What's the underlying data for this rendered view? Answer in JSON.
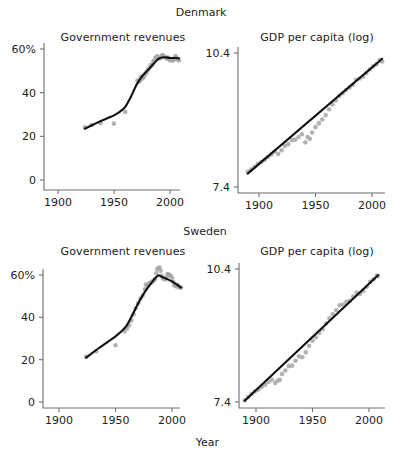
{
  "figure": {
    "x_axis_label": "Year",
    "groups": [
      {
        "name": "Denmark"
      },
      {
        "name": "Sweden"
      }
    ],
    "panel_titles": {
      "revenues": "Government revenues",
      "gdp": "GDP per capita (log)"
    },
    "colors": {
      "fit_line": "#101010",
      "points": "#a6a6a6",
      "axis": "#6e6e6e",
      "text": "#222222",
      "background": "#ffffff"
    }
  },
  "chart_data": [
    {
      "id": "denmark-government-revenues",
      "type": "scatter",
      "title": "Government revenues",
      "group": "Denmark",
      "xlabel": "Year",
      "ylabel": "",
      "xlim": [
        1885,
        2012
      ],
      "ylim": [
        0,
        65
      ],
      "xticks": [
        1900,
        1950,
        2000
      ],
      "xticklabels": [
        "1900",
        "1950",
        "2000"
      ],
      "yticks": [
        0,
        20,
        40,
        60
      ],
      "yticklabels": [
        "0",
        "20",
        "40",
        "60%"
      ],
      "grid": false,
      "legend": "none",
      "points": [
        [
          1924,
          24.1
        ],
        [
          1930,
          25.2
        ],
        [
          1938,
          26.0
        ],
        [
          1950,
          25.8
        ],
        [
          1960,
          31.2
        ],
        [
          1971,
          45.6
        ],
        [
          1972,
          45.1
        ],
        [
          1973,
          45.3
        ],
        [
          1974,
          47.3
        ],
        [
          1975,
          46.4
        ],
        [
          1976,
          46.9
        ],
        [
          1977,
          47.8
        ],
        [
          1978,
          48.8
        ],
        [
          1979,
          49.2
        ],
        [
          1980,
          50.3
        ],
        [
          1981,
          50.9
        ],
        [
          1982,
          51.6
        ],
        [
          1983,
          52.7
        ],
        [
          1984,
          52.6
        ],
        [
          1985,
          54.2
        ],
        [
          1986,
          54.6
        ],
        [
          1987,
          55.9
        ],
        [
          1988,
          56.4
        ],
        [
          1989,
          56.6
        ],
        [
          1990,
          55.8
        ],
        [
          1991,
          55.7
        ],
        [
          1992,
          56.1
        ],
        [
          1993,
          57.1
        ],
        [
          1994,
          57.0
        ],
        [
          1995,
          56.4
        ],
        [
          1996,
          56.1
        ],
        [
          1997,
          55.6
        ],
        [
          1998,
          56.1
        ],
        [
          1999,
          55.5
        ],
        [
          2000,
          54.7
        ],
        [
          2001,
          55.1
        ],
        [
          2002,
          54.9
        ],
        [
          2003,
          54.9
        ],
        [
          2004,
          55.7
        ],
        [
          2005,
          56.8
        ],
        [
          2006,
          55.8
        ],
        [
          2007,
          55.2
        ],
        [
          2008,
          54.8
        ]
      ],
      "fit_curve": [
        [
          1924,
          23.5
        ],
        [
          1930,
          25.0
        ],
        [
          1935,
          26.3
        ],
        [
          1940,
          27.4
        ],
        [
          1945,
          28.5
        ],
        [
          1950,
          29.6
        ],
        [
          1955,
          31.2
        ],
        [
          1960,
          33.5
        ],
        [
          1965,
          38.0
        ],
        [
          1970,
          43.5
        ],
        [
          1975,
          47.5
        ],
        [
          1980,
          50.2
        ],
        [
          1985,
          53.0
        ],
        [
          1990,
          55.6
        ],
        [
          1995,
          56.2
        ],
        [
          2000,
          55.9
        ],
        [
          2005,
          55.9
        ],
        [
          2008,
          55.7
        ]
      ]
    },
    {
      "id": "denmark-gdp-per-capita-log",
      "type": "scatter",
      "title": "GDP per capita (log)",
      "group": "Denmark",
      "xlabel": "Year",
      "ylabel": "",
      "xlim": [
        1885,
        2012
      ],
      "ylim": [
        7.4,
        10.55
      ],
      "xticks": [
        1900,
        1950,
        2000
      ],
      "xticklabels": [
        "1900",
        "1950",
        "2000"
      ],
      "yticks": [
        7.4,
        10.4
      ],
      "yticklabels": [
        "7.4",
        "10.4"
      ],
      "grid": false,
      "legend": "none",
      "points": [
        [
          1890,
          7.74
        ],
        [
          1893,
          7.79
        ],
        [
          1896,
          7.85
        ],
        [
          1899,
          7.92
        ],
        [
          1902,
          7.96
        ],
        [
          1905,
          8.01
        ],
        [
          1908,
          8.07
        ],
        [
          1911,
          8.13
        ],
        [
          1914,
          8.19
        ],
        [
          1917,
          8.14
        ],
        [
          1920,
          8.22
        ],
        [
          1923,
          8.32
        ],
        [
          1926,
          8.36
        ],
        [
          1929,
          8.45
        ],
        [
          1932,
          8.46
        ],
        [
          1935,
          8.52
        ],
        [
          1938,
          8.58
        ],
        [
          1941,
          8.4
        ],
        [
          1943,
          8.52
        ],
        [
          1945,
          8.48
        ],
        [
          1947,
          8.62
        ],
        [
          1950,
          8.74
        ],
        [
          1953,
          8.83
        ],
        [
          1956,
          8.91
        ],
        [
          1959,
          9.01
        ],
        [
          1962,
          9.14
        ],
        [
          1965,
          9.25
        ],
        [
          1968,
          9.34
        ],
        [
          1971,
          9.44
        ],
        [
          1974,
          9.5
        ],
        [
          1977,
          9.57
        ],
        [
          1980,
          9.63
        ],
        [
          1983,
          9.69
        ],
        [
          1986,
          9.8
        ],
        [
          1989,
          9.83
        ],
        [
          1992,
          9.87
        ],
        [
          1995,
          9.95
        ],
        [
          1998,
          10.03
        ],
        [
          2001,
          10.1
        ],
        [
          2004,
          10.15
        ],
        [
          2007,
          10.24
        ],
        [
          2009,
          10.21
        ]
      ],
      "fit_line": [
        [
          1890,
          7.7
        ],
        [
          2009,
          10.27
        ]
      ]
    },
    {
      "id": "sweden-government-revenues",
      "type": "scatter",
      "title": "Government revenues",
      "group": "Sweden",
      "xlabel": "Year",
      "ylabel": "",
      "xlim": [
        1885,
        2012
      ],
      "ylim": [
        0,
        68
      ],
      "xticks": [
        1900,
        1950,
        2000
      ],
      "xticklabels": [
        "1900",
        "1950",
        "2000"
      ],
      "yticks": [
        0,
        20,
        40,
        60
      ],
      "yticklabels": [
        "0",
        "20",
        "40",
        "60%"
      ],
      "grid": false,
      "legend": "none",
      "points": [
        [
          1924,
          21.3
        ],
        [
          1933,
          24.0
        ],
        [
          1950,
          26.8
        ],
        [
          1958,
          33.3
        ],
        [
          1960,
          34.6
        ],
        [
          1962,
          36.2
        ],
        [
          1964,
          38.5
        ],
        [
          1966,
          41.4
        ],
        [
          1968,
          44.3
        ],
        [
          1970,
          46.6
        ],
        [
          1972,
          48.9
        ],
        [
          1974,
          50.2
        ],
        [
          1976,
          53.3
        ],
        [
          1977,
          55.5
        ],
        [
          1978,
          55.1
        ],
        [
          1979,
          55.4
        ],
        [
          1980,
          56.2
        ],
        [
          1981,
          56.3
        ],
        [
          1982,
          56.5
        ],
        [
          1983,
          57.2
        ],
        [
          1984,
          57.4
        ],
        [
          1985,
          58.2
        ],
        [
          1986,
          60.8
        ],
        [
          1987,
          62.8
        ],
        [
          1988,
          63.2
        ],
        [
          1989,
          63.6
        ],
        [
          1990,
          62.0
        ],
        [
          1991,
          59.6
        ],
        [
          1992,
          58.5
        ],
        [
          1993,
          58.1
        ],
        [
          1994,
          58.0
        ],
        [
          1995,
          58.8
        ],
        [
          1996,
          60.5
        ],
        [
          1997,
          60.2
        ],
        [
          1998,
          59.8
        ],
        [
          1999,
          59.5
        ],
        [
          2000,
          58.7
        ],
        [
          2001,
          56.8
        ],
        [
          2002,
          55.2
        ],
        [
          2003,
          55.0
        ],
        [
          2004,
          54.6
        ],
        [
          2005,
          55.4
        ],
        [
          2006,
          54.5
        ],
        [
          2007,
          54.0
        ],
        [
          2008,
          54.2
        ]
      ],
      "fit_curve": [
        [
          1924,
          21.0
        ],
        [
          1930,
          23.4
        ],
        [
          1935,
          25.4
        ],
        [
          1940,
          27.2
        ],
        [
          1945,
          29.1
        ],
        [
          1950,
          31.0
        ],
        [
          1955,
          33.3
        ],
        [
          1960,
          36.2
        ],
        [
          1965,
          41.2
        ],
        [
          1970,
          46.5
        ],
        [
          1975,
          51.2
        ],
        [
          1980,
          55.0
        ],
        [
          1985,
          58.4
        ],
        [
          1988,
          59.8
        ],
        [
          1991,
          59.2
        ],
        [
          1995,
          58.2
        ],
        [
          2000,
          57.0
        ],
        [
          2005,
          55.2
        ],
        [
          2008,
          54.0
        ]
      ]
    },
    {
      "id": "sweden-gdp-per-capita-log",
      "type": "scatter",
      "title": "GDP per capita (log)",
      "group": "Sweden",
      "xlabel": "Year",
      "ylabel": "",
      "xlim": [
        1885,
        2012
      ],
      "ylim": [
        7.4,
        10.55
      ],
      "xticks": [
        1900,
        1950,
        2000
      ],
      "xticklabels": [
        "1900",
        "1950",
        "2000"
      ],
      "yticks": [
        7.4,
        10.4
      ],
      "yticklabels": [
        "7.4",
        "10.4"
      ],
      "grid": false,
      "legend": "none",
      "points": [
        [
          1890,
          7.44
        ],
        [
          1893,
          7.51
        ],
        [
          1896,
          7.58
        ],
        [
          1899,
          7.64
        ],
        [
          1902,
          7.68
        ],
        [
          1905,
          7.74
        ],
        [
          1908,
          7.79
        ],
        [
          1911,
          7.85
        ],
        [
          1914,
          7.9
        ],
        [
          1917,
          7.83
        ],
        [
          1919,
          7.88
        ],
        [
          1921,
          7.9
        ],
        [
          1923,
          8.03
        ],
        [
          1926,
          8.11
        ],
        [
          1929,
          8.21
        ],
        [
          1932,
          8.22
        ],
        [
          1935,
          8.33
        ],
        [
          1938,
          8.43
        ],
        [
          1941,
          8.41
        ],
        [
          1944,
          8.52
        ],
        [
          1947,
          8.67
        ],
        [
          1950,
          8.78
        ],
        [
          1953,
          8.86
        ],
        [
          1956,
          8.96
        ],
        [
          1959,
          9.04
        ],
        [
          1962,
          9.17
        ],
        [
          1965,
          9.29
        ],
        [
          1968,
          9.38
        ],
        [
          1971,
          9.47
        ],
        [
          1974,
          9.58
        ],
        [
          1977,
          9.6
        ],
        [
          1980,
          9.66
        ],
        [
          1983,
          9.68
        ],
        [
          1986,
          9.78
        ],
        [
          1989,
          9.87
        ],
        [
          1992,
          9.84
        ],
        [
          1995,
          9.91
        ],
        [
          1998,
          10.0
        ],
        [
          2001,
          10.11
        ],
        [
          2004,
          10.17
        ],
        [
          2007,
          10.25
        ],
        [
          2008,
          10.24
        ]
      ],
      "fit_line": [
        [
          1890,
          7.43
        ],
        [
          2008,
          10.26
        ]
      ]
    }
  ]
}
